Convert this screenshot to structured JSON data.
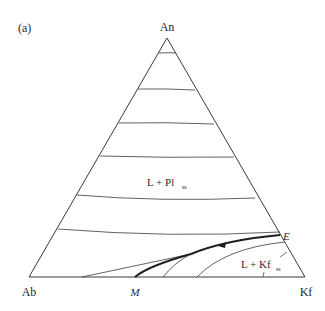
{
  "figure": {
    "panel_label": "(a)",
    "vertices": {
      "top": "An",
      "left": "Ab",
      "right": "Kf"
    },
    "fields": {
      "plagioclase": {
        "main": "L + Pl",
        "sub": "ss"
      },
      "kfeldspar": {
        "main": "L + Kf",
        "sub": "ss"
      }
    },
    "points": {
      "eutectic": "E",
      "minimum": "M"
    },
    "colors": {
      "line": "#3a3a3a",
      "background": "#ffffff"
    }
  }
}
